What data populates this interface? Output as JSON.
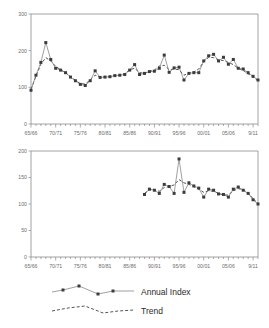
{
  "legend": {
    "entries": [
      {
        "label": "Annual Index",
        "style": "solid-with-markers",
        "color": "#777777",
        "marker_color": "#3c3c3c"
      },
      {
        "label": "Trend",
        "style": "dashed",
        "color": "#555555"
      }
    ]
  },
  "chart_data": [
    {
      "type": "line",
      "id": "top-chart",
      "title": "",
      "xlabel": "",
      "ylabel": "",
      "ylim": [
        0,
        300
      ],
      "yticks": [
        0,
        100,
        200,
        300
      ],
      "ytick_labels": [
        "0",
        "100",
        "200",
        "300"
      ],
      "grid": false,
      "legend_position": "below-figure",
      "xtick_labels": [
        "65/66",
        "70/71",
        "75/76",
        "80/81",
        "85/86",
        "90/91",
        "95/96",
        "00/01",
        "05/06",
        "9/11"
      ],
      "xtick_years": [
        1965,
        1970,
        1975,
        1980,
        1985,
        1990,
        1995,
        2000,
        2005,
        2010
      ],
      "xlim": [
        1965,
        2011
      ],
      "minor_ticks_every": 1,
      "series": [
        {
          "name": "Annual Index",
          "x": [
            1965,
            1966,
            1967,
            1968,
            1969,
            1970,
            1971,
            1972,
            1973,
            1974,
            1975,
            1976,
            1977,
            1978,
            1979,
            1980,
            1981,
            1982,
            1983,
            1984,
            1985,
            1986,
            1987,
            1988,
            1989,
            1990,
            1991,
            1992,
            1993,
            1994,
            1995,
            1996,
            1997,
            1998,
            1999,
            2000,
            2001,
            2002,
            2003,
            2004,
            2005,
            2006,
            2007,
            2008,
            2009,
            2010,
            2011
          ],
          "values": [
            92,
            133,
            168,
            222,
            176,
            152,
            147,
            140,
            128,
            118,
            108,
            105,
            118,
            145,
            127,
            128,
            129,
            132,
            133,
            135,
            147,
            162,
            135,
            138,
            143,
            144,
            152,
            188,
            141,
            153,
            155,
            120,
            138,
            140,
            140,
            172,
            186,
            190,
            172,
            182,
            163,
            176,
            152,
            150,
            140,
            130,
            120
          ]
        },
        {
          "name": "Trend",
          "x": [
            1965,
            1966,
            1967,
            1968,
            1969,
            1970,
            1971,
            1972,
            1973,
            1974,
            1975,
            1976,
            1977,
            1978,
            1979,
            1980,
            1981,
            1982,
            1983,
            1984,
            1985,
            1986,
            1987,
            1988,
            1989,
            1990,
            1991,
            1992,
            1993,
            1994,
            1995,
            1996,
            1997,
            1998,
            1999,
            2000,
            2001,
            2002,
            2003,
            2004,
            2005,
            2006,
            2007,
            2008,
            2009,
            2010,
            2011
          ],
          "values": [
            95,
            130,
            163,
            181,
            172,
            157,
            148,
            140,
            129,
            119,
            110,
            109,
            120,
            133,
            128,
            128,
            130,
            132,
            133,
            137,
            148,
            152,
            140,
            139,
            143,
            147,
            158,
            160,
            148,
            150,
            148,
            133,
            139,
            142,
            150,
            170,
            182,
            181,
            175,
            173,
            168,
            162,
            152,
            146,
            137,
            128,
            118
          ]
        }
      ]
    },
    {
      "type": "line",
      "id": "bottom-chart",
      "title": "",
      "xlabel": "",
      "ylabel": "",
      "ylim": [
        0,
        200
      ],
      "yticks": [
        0,
        50,
        100,
        150,
        200
      ],
      "ytick_labels": [
        "0",
        "50",
        "100",
        "150",
        "200"
      ],
      "grid": false,
      "legend_position": "below-figure",
      "xtick_labels": [
        "65/66",
        "70/71",
        "75/76",
        "80/81",
        "85/86",
        "90/91",
        "95/96",
        "00/01",
        "05/06",
        "9/11"
      ],
      "xtick_years": [
        1965,
        1970,
        1975,
        1980,
        1985,
        1990,
        1995,
        2000,
        2005,
        2010
      ],
      "xlim": [
        1965,
        2011
      ],
      "minor_ticks_every": 1,
      "series": [
        {
          "name": "Annual Index",
          "x": [
            1988,
            1989,
            1990,
            1991,
            1992,
            1993,
            1994,
            1995,
            1996,
            1997,
            1998,
            1999,
            2000,
            2001,
            2002,
            2003,
            2004,
            2005,
            2006,
            2007,
            2008,
            2009,
            2010,
            2011
          ],
          "values": [
            118,
            128,
            126,
            120,
            137,
            133,
            120,
            185,
            122,
            140,
            134,
            130,
            113,
            128,
            126,
            119,
            118,
            113,
            128,
            132,
            126,
            120,
            108,
            100
          ]
        },
        {
          "name": "Trend",
          "x": [
            1988,
            1989,
            1990,
            1991,
            1992,
            1993,
            1994,
            1995,
            1996,
            1997,
            1998,
            1999,
            2000,
            2001,
            2002,
            2003,
            2004,
            2005,
            2006,
            2007,
            2008,
            2009,
            2010,
            2011
          ],
          "values": [
            120,
            127,
            127,
            124,
            131,
            133,
            136,
            146,
            140,
            137,
            133,
            128,
            122,
            125,
            124,
            120,
            117,
            117,
            125,
            129,
            127,
            121,
            110,
            101
          ]
        }
      ]
    }
  ]
}
